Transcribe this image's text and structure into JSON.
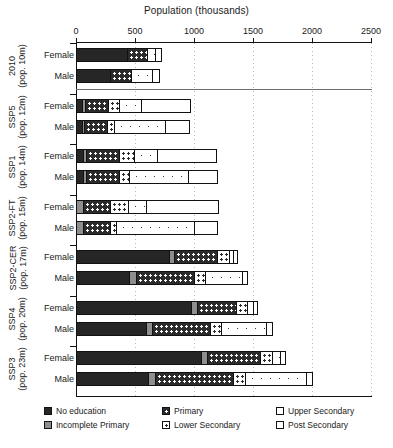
{
  "chart_data": {
    "type": "bar",
    "orientation": "horizontal",
    "stacked": true,
    "title": "Population (thousands)",
    "xlabel": "Population (thousands)",
    "ylabel": "",
    "xlim": [
      0,
      2500
    ],
    "xticks": [
      0,
      500,
      1000,
      1500,
      2000,
      2500
    ],
    "grid": "vertical-dotted",
    "legend_position": "bottom",
    "legend": [
      "No education",
      "Incomplete Primary",
      "Primary",
      "Lower Secondary",
      "Upper Secondary",
      "Post Secondary"
    ],
    "series": [
      {
        "name": "No education",
        "key": "no_education"
      },
      {
        "name": "Incomplete Primary",
        "key": "incomplete_primary"
      },
      {
        "name": "Primary",
        "key": "primary"
      },
      {
        "name": "Lower Secondary",
        "key": "lower_secondary"
      },
      {
        "name": "Upper Secondary",
        "key": "upper_secondary"
      },
      {
        "name": "Post Secondary",
        "key": "post_secondary"
      }
    ],
    "groups": [
      {
        "scenario": "2010",
        "population": "(pop. 10m)",
        "rows": [
          {
            "label": "Female",
            "values": [
              430,
              0,
              175,
              0,
              75,
              45
            ],
            "total": 725
          },
          {
            "label": "Male",
            "values": [
              285,
              0,
              180,
              0,
              190,
              55
            ],
            "total": 710
          }
        ]
      },
      {
        "scenario": "SSP5",
        "population": "(pop. 12m)",
        "rows": [
          {
            "label": "Female",
            "values": [
              45,
              20,
              200,
              100,
              190,
              420
            ],
            "total": 975
          },
          {
            "label": "Male",
            "values": [
              40,
              20,
              200,
              55,
              440,
              215
            ],
            "total": 970
          }
        ]
      },
      {
        "scenario": "SSP1",
        "population": "(pop. 14m)",
        "rows": [
          {
            "label": "Female",
            "values": [
              50,
              25,
              285,
              130,
              200,
              505
            ],
            "total": 1195
          },
          {
            "label": "Male",
            "values": [
              50,
              25,
              290,
              80,
              510,
              245
            ],
            "total": 1200
          }
        ]
      },
      {
        "scenario": "SSP2-FT",
        "population": "(pop. 15m)",
        "rows": [
          {
            "label": "Female",
            "values": [
              0,
              55,
              230,
              150,
              160,
              620
            ],
            "total": 1215
          },
          {
            "label": "Male",
            "values": [
              0,
              50,
              230,
              55,
              670,
              200
            ],
            "total": 1205
          }
        ]
      },
      {
        "scenario": "SSP2-CER",
        "population": "(pop. 17m)",
        "rows": [
          {
            "label": "Female",
            "values": [
              790,
              45,
              370,
              95,
              35,
              35
            ],
            "total": 1370
          },
          {
            "label": "Male",
            "values": [
              450,
              55,
              500,
              90,
              320,
              45
            ],
            "total": 1460
          }
        ]
      },
      {
        "scenario": "SSP4",
        "population": "(pop. 20m)",
        "rows": [
          {
            "label": "Female",
            "values": [
              980,
              45,
              340,
              90,
              50,
              35
            ],
            "total": 1540
          },
          {
            "label": "Male",
            "values": [
              590,
              50,
              500,
              95,
              380,
              55
            ],
            "total": 1670
          }
        ]
      },
      {
        "scenario": "SSP3",
        "population": "(pop. 23m)",
        "rows": [
          {
            "label": "Female",
            "values": [
              1060,
              55,
              450,
              100,
              75,
              40
            ],
            "total": 1780
          },
          {
            "label": "Male",
            "values": [
              610,
              55,
              670,
              105,
              520,
              45
            ],
            "total": 2005
          }
        ]
      }
    ]
  },
  "colors": {
    "no_education": "#262626",
    "incomplete_primary": "#8e8e8e",
    "primary": "#2b2b2b",
    "lower_secondary": "#ffffff",
    "upper_secondary": "#ffffff",
    "post_secondary": "#ffffff",
    "axis": "#111111",
    "grid": "#b9b9b9"
  }
}
